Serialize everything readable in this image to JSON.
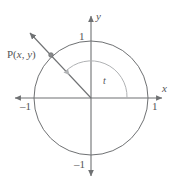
{
  "figure": {
    "kind": "unit-circle-diagram",
    "background_color": "#ffffff",
    "stroke_color": "#6f7173",
    "arc_color": "#a9abad",
    "label_color": "#555557",
    "axes": {
      "x_axis_name": "x",
      "y_axis_name": "y",
      "x_ticks": [
        {
          "label": "1",
          "value": 1
        },
        {
          "label": "–1",
          "value": -1
        }
      ],
      "y_ticks": [
        {
          "label": "1",
          "value": 1
        },
        {
          "label": "–1",
          "value": -1
        }
      ]
    },
    "circle": {
      "center": [
        0,
        0
      ],
      "radius": 1,
      "center_px": [
        91,
        98
      ],
      "radius_px": 57
    },
    "angle": {
      "label": "t",
      "from_axis": "positive-x",
      "direction": "counterclockwise",
      "degrees": 135
    },
    "point": {
      "name": "P",
      "coord_label": "P(x, y)",
      "name_text": "P(",
      "x_text": "x",
      "comma_text": ", ",
      "y_text": "y",
      "close_text": ")",
      "on_circle": true,
      "position_px": [
        51,
        55
      ]
    },
    "terminal_ray": {
      "from_px": [
        91,
        98
      ],
      "through_px": [
        51,
        55
      ],
      "arrow_tip_px": [
        28,
        31
      ],
      "has_arrowhead": true
    }
  }
}
